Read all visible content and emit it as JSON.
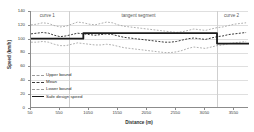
{
  "chart_data": {
    "type": "line",
    "title": "",
    "xlabel": "Distance (m)",
    "ylabel": "Speed (km/h)",
    "xlim": [
      50,
      3800
    ],
    "ylim": [
      0,
      140
    ],
    "grid": true,
    "legend_position": "inside-left",
    "xticks": [
      50,
      550,
      1050,
      1550,
      2050,
      2550,
      3050,
      3550
    ],
    "xticklabels": [
      "50",
      "550",
      "1050",
      "1550",
      "2050",
      "2550",
      "3050",
      "3550"
    ],
    "yticks": [
      0,
      20,
      40,
      60,
      80,
      100,
      120,
      140
    ],
    "yticklabels": [
      "0",
      "20",
      "40",
      "60",
      "80",
      "100",
      "120",
      "140"
    ],
    "annotations": [
      {
        "text": "curve 1",
        "x": 330,
        "y": 133
      },
      {
        "text": "tangent segment",
        "x": 1900,
        "y": 133
      },
      {
        "text": "curve 2",
        "x": 3500,
        "y": 133
      }
    ],
    "region_dividers": [
      700,
      3250
    ],
    "series": [
      {
        "name": "Upper bound",
        "style": "dashed",
        "color": "#9a9a9a",
        "width": 0.8,
        "x": [
          50,
          150,
          250,
          350,
          450,
          550,
          650,
          750,
          850,
          950,
          1050,
          1150,
          1250,
          1350,
          1450,
          1550,
          1650,
          1750,
          1850,
          1950,
          2050,
          2150,
          2250,
          2350,
          2450,
          2550,
          2650,
          2750,
          2850,
          2950,
          3050,
          3150,
          3250,
          3350,
          3450,
          3550,
          3650,
          3750
        ],
        "values": [
          120,
          121,
          123,
          122,
          119,
          117,
          118,
          121,
          124,
          123,
          121,
          120,
          122,
          124,
          123,
          120,
          118,
          117,
          116,
          115,
          114,
          113,
          112,
          111,
          110,
          109,
          110,
          112,
          114,
          113,
          112,
          114,
          116,
          117,
          119,
          121,
          122,
          123
        ]
      },
      {
        "name": "Mean",
        "style": "dashed",
        "color": "#3b3b3b",
        "width": 1.0,
        "x": [
          50,
          150,
          250,
          350,
          450,
          550,
          650,
          750,
          850,
          950,
          1050,
          1150,
          1250,
          1350,
          1450,
          1550,
          1650,
          1750,
          1850,
          1950,
          2050,
          2150,
          2250,
          2350,
          2450,
          2550,
          2650,
          2750,
          2850,
          2950,
          3050,
          3150,
          3250,
          3350,
          3450,
          3550,
          3650,
          3750
        ],
        "values": [
          107,
          108,
          109,
          108,
          105,
          103,
          104,
          106,
          108,
          107,
          106,
          105,
          106,
          107,
          106,
          104,
          102,
          101,
          100,
          99,
          98,
          97,
          96,
          95,
          95,
          96,
          98,
          100,
          101,
          100,
          99,
          101,
          103,
          104,
          106,
          107,
          108,
          109
        ]
      },
      {
        "name": "Lower bound",
        "style": "dashed",
        "color": "#9a9a9a",
        "width": 0.8,
        "x": [
          50,
          150,
          250,
          350,
          450,
          550,
          650,
          750,
          850,
          950,
          1050,
          1150,
          1250,
          1350,
          1450,
          1550,
          1650,
          1750,
          1850,
          1950,
          2050,
          2150,
          2250,
          2350,
          2450,
          2550,
          2650,
          2750,
          2850,
          2950,
          3050,
          3150,
          3250,
          3350,
          3450,
          3550,
          3650,
          3750
        ],
        "values": [
          95,
          95,
          96,
          95,
          92,
          90,
          90,
          92,
          94,
          93,
          92,
          91,
          91,
          92,
          91,
          89,
          87,
          86,
          85,
          84,
          83,
          82,
          81,
          80,
          80,
          81,
          83,
          86,
          88,
          87,
          86,
          88,
          90,
          91,
          93,
          94,
          95,
          96
        ]
      },
      {
        "name": "Safe design speed",
        "style": "solid",
        "color": "#1a1a1a",
        "width": 1.8,
        "step": true,
        "x": [
          50,
          950,
          950,
          3250,
          3250,
          3800
        ],
        "values": [
          100,
          100,
          108,
          108,
          93,
          93
        ]
      }
    ]
  },
  "legend": {
    "items": [
      {
        "label": "Upper bound",
        "swatch": "sw-upper"
      },
      {
        "label": "Mean",
        "swatch": "sw-mean"
      },
      {
        "label": "Lower bound",
        "swatch": "sw-lower"
      },
      {
        "label": "Safe design speed",
        "swatch": "sw-safe"
      }
    ]
  },
  "colors": {
    "axis": "#8c8c8c",
    "grid": "#dfdfdf",
    "divider": "#cfcfcf",
    "upper_bound": "#9a9a9a",
    "mean": "#3b3b3b",
    "lower_bound": "#9a9a9a",
    "safe_design_speed": "#1a1a1a"
  }
}
